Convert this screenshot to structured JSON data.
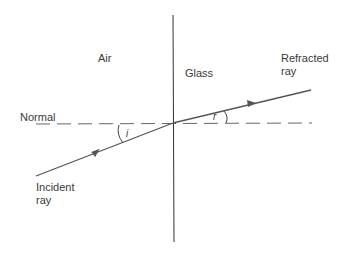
{
  "diagram": {
    "labels": {
      "air": "Air",
      "glass": "Glass",
      "normal": "Normal",
      "incident_line1": "Incident",
      "incident_line2": "ray",
      "refracted_line1": "Refracted",
      "refracted_line2": "ray",
      "angle_incidence": "i",
      "angle_refraction": "r"
    },
    "colors": {
      "line": "#555555",
      "boundary": "#333333",
      "text": "#3a3a3a"
    }
  }
}
